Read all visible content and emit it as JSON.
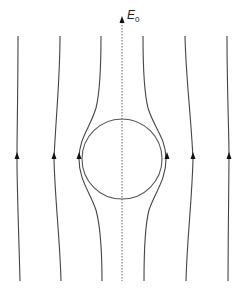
{
  "diagram": {
    "field_label": "E",
    "field_subscript": "0",
    "colors": {
      "field_lines": "#444444",
      "sphere": "#555555",
      "axis": "#666666",
      "arrows": "#111111"
    },
    "sphere": {
      "cx": 122,
      "cy": 159,
      "r": 40
    },
    "field_lines": [
      {
        "id": "outer-left",
        "x_top": 18,
        "x_mid": 17,
        "x_bottom": 20
      },
      {
        "id": "middle-left",
        "x_top": 60,
        "x_mid": 54,
        "x_bottom": 61
      },
      {
        "id": "inner-left",
        "x_top": 101,
        "x_mid": 79,
        "x_bottom": 102
      },
      {
        "id": "inner-right",
        "x_top": 143,
        "x_mid": 168,
        "x_bottom": 144
      },
      {
        "id": "middle-right",
        "x_top": 185,
        "x_mid": 193,
        "x_bottom": 186
      },
      {
        "id": "outer-right",
        "x_top": 227,
        "x_mid": 229,
        "x_bottom": 228
      }
    ],
    "axis": {
      "x": 122,
      "y_top": 17,
      "y_bottom": 281
    }
  }
}
